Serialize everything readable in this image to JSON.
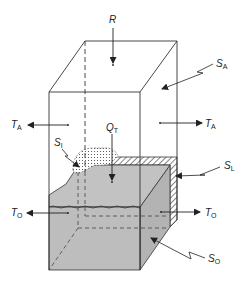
{
  "diagram": {
    "type": "box-model-schematic",
    "labels": {
      "R": {
        "main": "R",
        "sub": ""
      },
      "S_A": {
        "main": "S",
        "sub": "A"
      },
      "T_A_left": {
        "main": "T",
        "sub": "A"
      },
      "T_A_right": {
        "main": "T",
        "sub": "A"
      },
      "Q_T": {
        "main": "Q",
        "sub": "T"
      },
      "S_I": {
        "main": "S",
        "sub": "I"
      },
      "S_L": {
        "main": "S",
        "sub": "L"
      },
      "T_O_left": {
        "main": "T",
        "sub": "O"
      },
      "T_O_right": {
        "main": "T",
        "sub": "O"
      },
      "S_O": {
        "main": "S",
        "sub": "O"
      }
    },
    "components": [
      {
        "name": "atmosphere-box",
        "label": "S_A",
        "fill": "none"
      },
      {
        "name": "ocean-block",
        "label": "S_O",
        "fill": "#bdbdbd"
      },
      {
        "name": "land-strip",
        "label": "S_L",
        "pattern": "hatched"
      },
      {
        "name": "ice-region",
        "label": "S_I",
        "pattern": "dotted"
      }
    ],
    "fluxes": [
      {
        "name": "radiation-input",
        "label": "R",
        "direction": "down"
      },
      {
        "name": "atmosphere-transport-left",
        "label": "T_A",
        "direction": "left"
      },
      {
        "name": "atmosphere-transport-right",
        "label": "T_A",
        "direction": "right"
      },
      {
        "name": "heat-flux-atmosphere-ocean",
        "label": "Q_T",
        "direction": "down"
      },
      {
        "name": "ocean-transport-left",
        "label": "T_O",
        "direction": "left"
      },
      {
        "name": "ocean-transport-right",
        "label": "T_O",
        "direction": "right"
      }
    ],
    "colors": {
      "line": "#333333",
      "ocean": "#bdbdbd",
      "ocean_side": "#b0b0b0",
      "background": "#ffffff"
    }
  }
}
